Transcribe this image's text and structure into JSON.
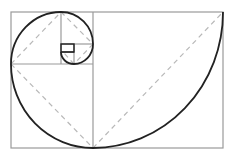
{
  "diagram": {
    "type": "golden-spiral",
    "colors": {
      "background": "#ffffff",
      "grid_line": "#9a9a9a",
      "diagonal_dash": "#b8b8b8",
      "spiral": "#222222"
    },
    "outer_rect": {
      "x": 11,
      "y": 12,
      "w": 212,
      "h": 136
    },
    "squares": [
      {
        "x": 93,
        "y": 12,
        "w": 130,
        "h": 136
      },
      {
        "x": 11,
        "y": 64,
        "w": 82,
        "h": 84
      },
      {
        "x": 11,
        "y": 12,
        "w": 50,
        "h": 52
      },
      {
        "x": 61,
        "y": 12,
        "w": 32,
        "h": 32
      },
      {
        "x": 74,
        "y": 44,
        "w": 19,
        "h": 20
      },
      {
        "x": 61,
        "y": 52,
        "w": 13,
        "h": 12
      },
      {
        "x": 61,
        "y": 44,
        "w": 13,
        "h": 8
      }
    ]
  }
}
